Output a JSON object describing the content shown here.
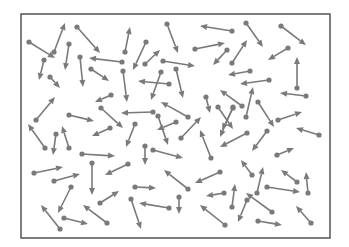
{
  "diagram": {
    "title": "",
    "colors": {
      "arrow": "#7a7a7a",
      "border": "#555555",
      "background": "#ffffff"
    },
    "frame": {
      "x": 21,
      "y": 14,
      "width": 309,
      "height": 224
    },
    "arrows": [
      [
        29,
        42,
        55,
        58
      ],
      [
        54,
        52,
        65,
        23
      ],
      [
        77,
        27,
        100,
        53
      ],
      [
        69,
        44,
        65,
        70
      ],
      [
        44,
        60,
        39,
        80
      ],
      [
        80,
        57,
        83,
        87
      ],
      [
        122,
        62,
        89,
        58
      ],
      [
        91,
        69,
        109,
        81
      ],
      [
        50,
        77,
        60,
        88
      ],
      [
        125,
        52,
        130,
        27
      ],
      [
        146,
        42,
        133,
        70
      ],
      [
        145,
        64,
        160,
        50
      ],
      [
        167,
        24,
        178,
        53
      ],
      [
        163,
        61,
        195,
        66
      ],
      [
        195,
        49,
        225,
        43
      ],
      [
        232,
        31,
        200,
        26
      ],
      [
        169,
        84,
        138,
        81
      ],
      [
        161,
        72,
        151,
        100
      ],
      [
        176,
        69,
        183,
        98
      ],
      [
        123,
        71,
        127,
        102
      ],
      [
        246,
        23,
        263,
        47
      ],
      [
        281,
        26,
        306,
        45
      ],
      [
        232,
        63,
        247,
        40
      ],
      [
        288,
        48,
        268,
        60
      ],
      [
        250,
        71,
        228,
        75
      ],
      [
        269,
        80,
        240,
        84
      ],
      [
        297,
        88,
        297,
        57
      ],
      [
        227,
        50,
        213,
        65
      ],
      [
        36,
        120,
        55,
        97
      ],
      [
        69,
        115,
        94,
        121
      ],
      [
        111,
        95,
        95,
        102
      ],
      [
        101,
        108,
        123,
        128
      ],
      [
        110,
        128,
        92,
        136
      ],
      [
        45,
        148,
        28,
        124
      ],
      [
        56,
        134,
        53,
        155
      ],
      [
        69,
        148,
        62,
        126
      ],
      [
        82,
        154,
        115,
        156
      ],
      [
        153,
        112,
        121,
        113
      ],
      [
        188,
        117,
        161,
        102
      ],
      [
        158,
        116,
        168,
        145
      ],
      [
        176,
        122,
        157,
        130
      ],
      [
        135,
        124,
        126,
        147
      ],
      [
        181,
        138,
        201,
        117
      ],
      [
        206,
        97,
        210,
        113
      ],
      [
        211,
        158,
        200,
        130
      ],
      [
        145,
        146,
        145,
        165
      ],
      [
        153,
        150,
        183,
        158
      ],
      [
        306,
        96,
        280,
        93
      ],
      [
        246,
        117,
        253,
        87
      ],
      [
        242,
        106,
        220,
        90
      ],
      [
        258,
        102,
        274,
        127
      ],
      [
        278,
        120,
        302,
        112
      ],
      [
        319,
        135,
        296,
        128
      ],
      [
        233,
        108,
        222,
        130
      ],
      [
        267,
        131,
        252,
        151
      ],
      [
        247,
        133,
        220,
        147
      ],
      [
        277,
        155,
        294,
        148
      ],
      [
        34,
        173,
        63,
        167
      ],
      [
        54,
        181,
        80,
        174
      ],
      [
        92,
        163,
        92,
        195
      ],
      [
        71,
        187,
        58,
        213
      ],
      [
        100,
        203,
        119,
        191
      ],
      [
        60,
        229,
        41,
        205
      ],
      [
        64,
        218,
        88,
        224
      ],
      [
        107,
        223,
        83,
        205
      ],
      [
        128,
        164,
        105,
        175
      ],
      [
        135,
        187,
        156,
        188
      ],
      [
        131,
        199,
        141,
        229
      ],
      [
        169,
        208,
        139,
        203
      ],
      [
        179,
        197,
        179,
        214
      ],
      [
        188,
        189,
        164,
        170
      ],
      [
        220,
        172,
        195,
        183
      ],
      [
        224,
        193,
        206,
        196
      ],
      [
        225,
        225,
        200,
        205
      ],
      [
        257,
        193,
        263,
        167
      ],
      [
        267,
        187,
        300,
        192
      ],
      [
        297,
        182,
        281,
        170
      ],
      [
        308,
        193,
        306,
        172
      ],
      [
        272,
        212,
        246,
        193
      ],
      [
        247,
        200,
        238,
        222
      ],
      [
        232,
        207,
        235,
        184
      ],
      [
        258,
        221,
        282,
        225
      ],
      [
        311,
        223,
        296,
        206
      ],
      [
        252,
        175,
        241,
        160
      ],
      [
        233,
        107,
        220,
        137
      ],
      [
        218,
        107,
        233,
        129
      ]
    ]
  }
}
